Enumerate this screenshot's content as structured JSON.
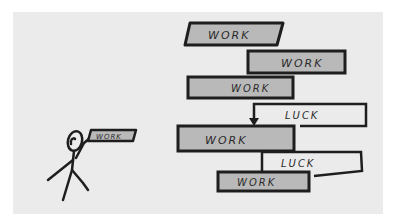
{
  "illustration": {
    "description": "Stick figure holding a small WORK block, next to a tall staircase of WORK blocks with LUCK connectors",
    "figure_block_label": "WORK",
    "blocks": [
      {
        "label": "WORK",
        "type": "work",
        "shape": "parallelogram"
      },
      {
        "label": "WORK",
        "type": "work"
      },
      {
        "label": "WORK",
        "type": "work"
      },
      {
        "label": "LUCK",
        "type": "luck"
      },
      {
        "label": "WORK",
        "type": "work"
      },
      {
        "label": "LUCK",
        "type": "luck"
      },
      {
        "label": "WORK",
        "type": "work"
      }
    ],
    "colors": {
      "background": "#ebebeb",
      "page": "#ffffff",
      "work_fill": "#b9b9b9",
      "luck_fill": "#f2f2f2",
      "stroke": "#1e1e1e"
    }
  }
}
